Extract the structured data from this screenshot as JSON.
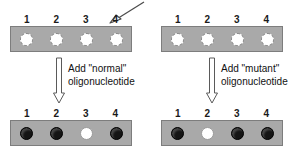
{
  "figure": {
    "spot_labels": [
      "1",
      "2",
      "3",
      "4"
    ]
  },
  "panels": [
    {
      "id": "normal-oligonucleotide",
      "caption_line1": "Add \"normal\"",
      "caption_line2": "oligonucleotide",
      "pointer": {
        "name": "pointer-arrow-to-spot-4",
        "direction": "down-left",
        "target_spot": "4"
      },
      "before": {
        "name": "strip-before",
        "labels": [
          "1",
          "2",
          "3",
          "4"
        ],
        "spots": [
          "blank",
          "blank",
          "blank",
          "blank"
        ]
      },
      "after": {
        "name": "strip-after",
        "labels": [
          "1",
          "2",
          "3",
          "4"
        ],
        "spots": [
          "filled",
          "filled",
          "negative",
          "filled"
        ]
      }
    },
    {
      "id": "mutant-oligonucleotide",
      "caption_line1": "Add \"mutant\"",
      "caption_line2": "oligonucleotide",
      "pointer": {
        "name": "pointer-arrow-to-spot-1",
        "direction": "down-right",
        "target_spot": "1"
      },
      "before": {
        "name": "strip-before",
        "labels": [
          "1",
          "2",
          "3",
          "4"
        ],
        "spots": [
          "blank",
          "blank",
          "blank",
          "blank"
        ]
      },
      "after": {
        "name": "strip-after",
        "labels": [
          "1",
          "2",
          "3",
          "4"
        ],
        "spots": [
          "filled",
          "negative",
          "filled",
          "filled"
        ]
      }
    }
  ],
  "colors": {
    "membrane": "#a9a9a9",
    "membrane_border": "#7d7d7d",
    "spot_filled": "#141414",
    "spot_blank": "#ffffff",
    "arrow_outline": "#4a4a4a",
    "background": "#ffffff"
  }
}
